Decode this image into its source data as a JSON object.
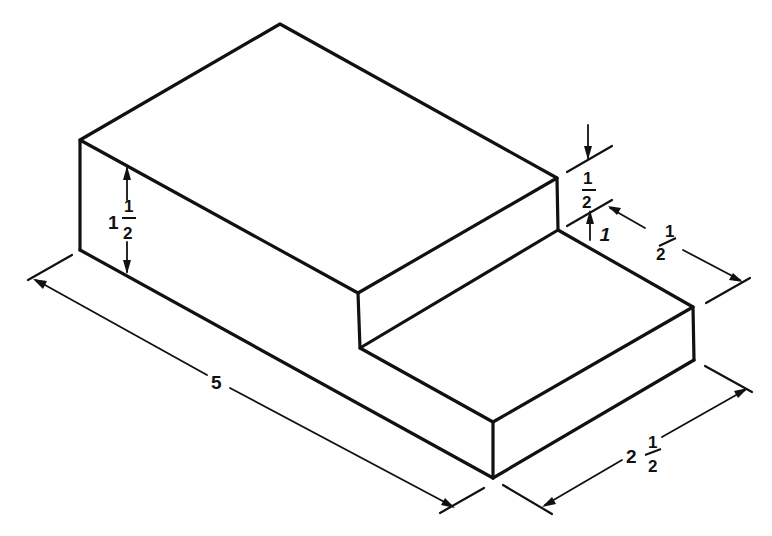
{
  "figure": {
    "colors": {
      "line": "#111111",
      "background": "#ffffff"
    }
  },
  "dimensions": {
    "tall_height": {
      "whole": "1",
      "num": "1",
      "den": "2"
    },
    "length": {
      "whole": "5"
    },
    "step_drop": {
      "num": "1",
      "den": "2"
    },
    "step_depth": {
      "whole": "1",
      "num": "1",
      "den": "2"
    },
    "width": {
      "whole": "2",
      "num": "1",
      "den": "2"
    }
  }
}
